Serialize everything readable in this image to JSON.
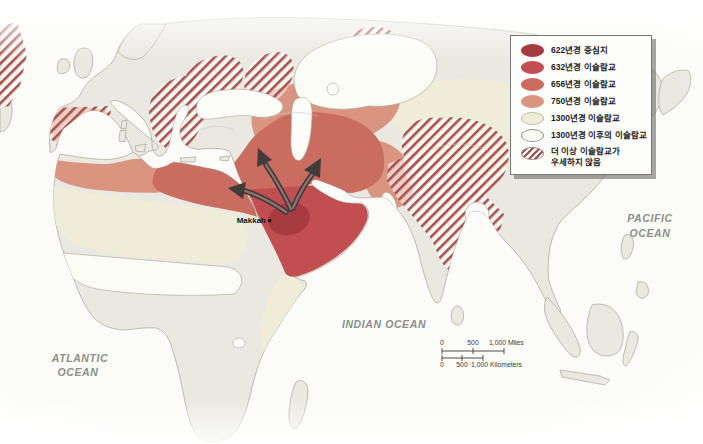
{
  "legend": {
    "items": [
      {
        "label": "622년경 중심지",
        "color": "#a63b41",
        "swatch": "solid"
      },
      {
        "label": "632년경 이슬람교",
        "color": "#c14e50",
        "swatch": "solid"
      },
      {
        "label": "656년경 이슬람교",
        "color": "#cb6c60",
        "swatch": "solid"
      },
      {
        "label": "750년경 이슬람교",
        "color": "#d9957f",
        "swatch": "solid"
      },
      {
        "label": "1300년경 이슬람교",
        "color": "#efecd8",
        "swatch": "solid"
      },
      {
        "label": "1300년경 이후의 이슬람교",
        "color": "#fcfcf7",
        "swatch": "outlined"
      },
      {
        "label": "더 이상 이슬람교가",
        "label2": "우세하지 않음",
        "color": "#a8514d",
        "swatch": "hatched"
      }
    ]
  },
  "place_labels": {
    "atlantic1": "ATLANTIC",
    "atlantic2": "OCEAN",
    "indian": "INDIAN OCEAN",
    "pacific1": "PACIFIC",
    "pacific2": "OCEAN",
    "makkah": "Makkah"
  },
  "scale_bar": {
    "miles_0": "0",
    "miles_500": "500",
    "miles_1000": "1,000 Miles",
    "km_0": "0",
    "km_500": "500",
    "km_1000": "1,000 Kilometers"
  },
  "colors": {
    "ocean": "#fbfbf8",
    "land": "#e9e8e1",
    "coastline": "#a8a396",
    "islam_622": "#a63b41",
    "islam_632": "#c14e50",
    "islam_656": "#cb6c60",
    "islam_750": "#d9957f",
    "islam_1300": "#efecd8",
    "islam_after_1300": "#fcfcf7",
    "hatch_stripe": "#a8514d",
    "arrow": "#413c3a"
  }
}
